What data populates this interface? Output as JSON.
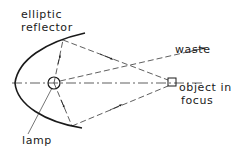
{
  "labels": {
    "reflector_line1": "elliptic",
    "reflector_line2": "reflector",
    "waste": "waste",
    "object_line1": "object in",
    "object_line2": "focus",
    "lamp": "lamp"
  },
  "colors": {
    "ink": "#1a1a1a",
    "background": "#ffffff"
  }
}
